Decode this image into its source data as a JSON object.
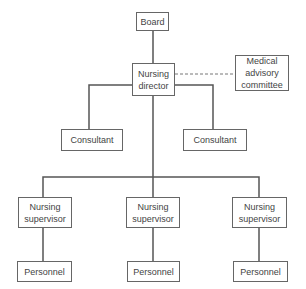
{
  "nodes": {
    "board": "Board",
    "director": "Nursing\ndirector",
    "medical": "Medical\nadvisory\ncommittee",
    "consultant_left": "Consultant",
    "consultant_right": "Consultant",
    "supervisor_left": "Nursing\nsupervisor",
    "supervisor_center": "Nursing\nsupervisor",
    "supervisor_right": "Nursing\nsupervisor",
    "personnel_left": "Personnel",
    "personnel_center": "Personnel",
    "personnel_right": "Personnel"
  },
  "colors": {
    "line": "#555555",
    "border": "#666666",
    "text": "#444444"
  }
}
